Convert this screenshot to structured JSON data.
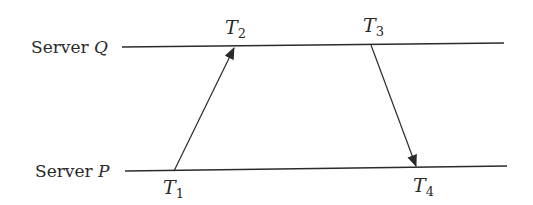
{
  "diagram": {
    "type": "sequence-timing",
    "servers": [
      {
        "id": "Q",
        "prefix": "Server ",
        "name": "Q",
        "line": {
          "x1": 122,
          "y1": 47,
          "x2": 504,
          "y2": 43
        }
      },
      {
        "id": "P",
        "prefix": "Server ",
        "name": "P",
        "line": {
          "x1": 125,
          "y1": 171,
          "x2": 507,
          "y2": 166
        }
      }
    ],
    "timestamps": [
      {
        "id": "T1",
        "letter": "T",
        "sub": "1",
        "server": "P"
      },
      {
        "id": "T2",
        "letter": "T",
        "sub": "2",
        "server": "Q"
      },
      {
        "id": "T3",
        "letter": "T",
        "sub": "3",
        "server": "Q"
      },
      {
        "id": "T4",
        "letter": "T",
        "sub": "4",
        "server": "P"
      }
    ],
    "messages": [
      {
        "from": "T1",
        "to": "T2",
        "direction": "P to Q"
      },
      {
        "from": "T3",
        "to": "T4",
        "direction": "Q to P"
      }
    ],
    "colors": {
      "line": "#2a2a2a",
      "text": "#2a2a2a",
      "background": "#ffffff"
    }
  }
}
